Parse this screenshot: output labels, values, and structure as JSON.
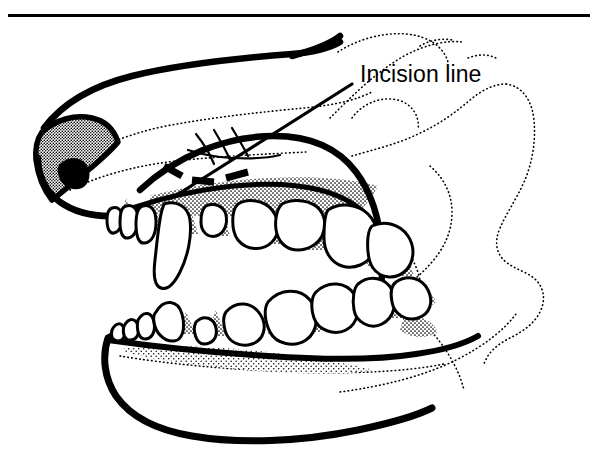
{
  "figure": {
    "title_rule": {
      "name": "header-rule",
      "color": "#000000"
    },
    "background_color": "#ffffff",
    "ink_color": "#000000",
    "stipple_color": "#000000",
    "annotations": [
      {
        "id": "incision-line",
        "label": "Incision line",
        "leader": "diagonal leader line from label to dashed marks over the upper muzzle"
      }
    ],
    "legend": {
      "dashed_marks_meaning": "Incision line"
    },
    "structures": [
      "nose",
      "nostril",
      "upper lip outline",
      "hard palate",
      "upper canine",
      "upper incisors",
      "upper premolars and molars",
      "gingiva",
      "mandible",
      "lower incisors",
      "lower canine",
      "lower premolars and molars",
      "skull contour (dotted)",
      "zygomatic arch contour (dotted)",
      "cheek contour (dotted)"
    ]
  }
}
